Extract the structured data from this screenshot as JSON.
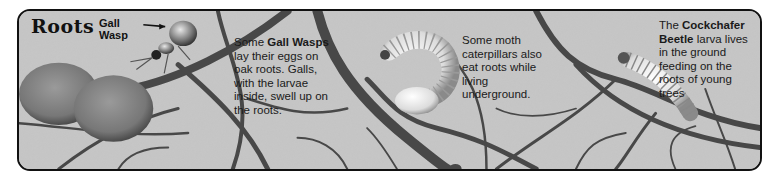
{
  "title": "Roots",
  "labels": {
    "gall_wasp": [
      "Gall",
      "Wasp"
    ]
  },
  "captions": [
    {
      "id": "gall-wasp",
      "lines": [
        {
          "parts": [
            {
              "text": "Some ",
              "bold": false
            },
            {
              "text": "Gall Wasps",
              "bold": true
            }
          ]
        },
        {
          "parts": [
            {
              "text": "lay their eggs on",
              "bold": false
            }
          ]
        },
        {
          "parts": [
            {
              "text": "oak roots. Galls,",
              "bold": false
            }
          ]
        },
        {
          "parts": [
            {
              "text": "with the larvae",
              "bold": false
            }
          ]
        },
        {
          "parts": [
            {
              "text": "inside, swell up on",
              "bold": false
            }
          ]
        },
        {
          "parts": [
            {
              "text": "the roots.",
              "bold": false
            }
          ]
        }
      ]
    },
    {
      "id": "moth-caterpillar",
      "lines": [
        {
          "parts": [
            {
              "text": "Some moth",
              "bold": false
            }
          ]
        },
        {
          "parts": [
            {
              "text": "caterpillars also",
              "bold": false
            }
          ]
        },
        {
          "parts": [
            {
              "text": "eat roots while",
              "bold": false
            }
          ]
        },
        {
          "parts": [
            {
              "text": "living",
              "bold": false
            }
          ]
        },
        {
          "parts": [
            {
              "text": "underground.",
              "bold": false
            }
          ]
        }
      ]
    },
    {
      "id": "cockchafer",
      "lines": [
        {
          "parts": [
            {
              "text": "The ",
              "bold": false
            },
            {
              "text": "Cockchafer",
              "bold": true
            }
          ]
        },
        {
          "parts": [
            {
              "text": "Beetle",
              "bold": true
            },
            {
              "text": " larva lives",
              "bold": false
            }
          ]
        },
        {
          "parts": [
            {
              "text": "in the ground",
              "bold": false
            }
          ]
        },
        {
          "parts": [
            {
              "text": "feeding on the",
              "bold": false
            }
          ]
        },
        {
          "parts": [
            {
              "text": "roots of young",
              "bold": false
            }
          ]
        },
        {
          "parts": [
            {
              "text": "trees",
              "bold": false
            }
          ]
        }
      ]
    }
  ],
  "colors": {
    "soil": "#c9c9c9",
    "root": "#4a4a4a",
    "border": "#111111"
  }
}
